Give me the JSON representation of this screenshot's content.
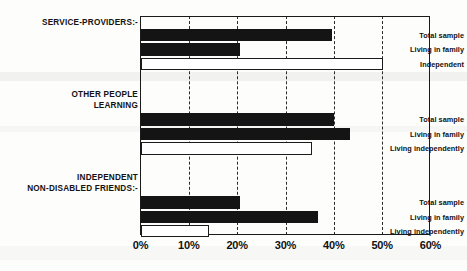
{
  "chart_data": {
    "type": "bar",
    "orientation": "horizontal",
    "title": "",
    "xlabel": "",
    "ylabel": "",
    "xlim": [
      0,
      60
    ],
    "xticks": [
      "0%",
      "10%",
      "20%",
      "30%",
      "40%",
      "50%",
      "60%"
    ],
    "xtick_values": [
      0,
      10,
      20,
      30,
      40,
      50,
      60
    ],
    "grid": true,
    "legend": "none",
    "unit": "%",
    "colors": {
      "filled_bar": "#141414",
      "hollow_bar_fill": "#ffffff",
      "hollow_bar_edge": "#1b1b1b",
      "axis": "#1a1a1a",
      "gridline": "#2a2a2a",
      "background": "#fdfdfc"
    },
    "groups": [
      {
        "name": "SERVICE-PROVIDERS:-",
        "categories": [
          "Total sample",
          "Living in family",
          "Independent"
        ],
        "values": [
          39.5,
          20.5,
          50.0
        ],
        "styles": [
          "filled",
          "filled",
          "hollow"
        ]
      },
      {
        "name": "OTHER PEOPLE\nLEARNING",
        "categories": [
          "Total sample",
          "Living in family",
          "Living independently"
        ],
        "values": [
          40.0,
          43.3,
          35.3
        ],
        "styles": [
          "filled",
          "filled",
          "hollow"
        ]
      },
      {
        "name": "INDEPENDENT\nNON-DISABLED FRIENDS:-",
        "categories": [
          "Total sample",
          "Living in family",
          "Living independently"
        ],
        "values": [
          20.4,
          36.7,
          14.1
        ],
        "styles": [
          "filled",
          "filled",
          "hollow"
        ]
      }
    ]
  }
}
